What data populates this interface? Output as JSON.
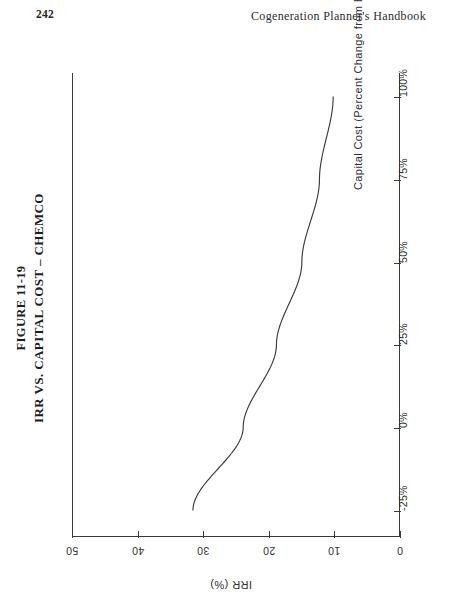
{
  "page": {
    "folio": "242",
    "running_head": "Cogeneration Planner's Handbook"
  },
  "figure": {
    "number": "FIGURE 11-19",
    "title": "IRR VS. CAPITAL COST – CHEMCO",
    "orientation": "rotated-90-ccw"
  },
  "chart_data": {
    "type": "line",
    "title": "IRR VS. CAPITAL COST – CHEMCO",
    "xlabel": "Capital Cost (Percent Change from Base)",
    "ylabel": "IRR (%)",
    "x": [
      -25,
      0,
      25,
      50,
      75,
      100
    ],
    "values": [
      31.6,
      23.9,
      18.8,
      14.9,
      12.2,
      10.1
    ],
    "xtick_labels": [
      "-25%",
      "0%",
      "25%",
      "50%",
      "75%",
      "100%"
    ],
    "ytick_labels": [
      "50",
      "40",
      "30",
      "20",
      "10",
      "0"
    ],
    "ytick_values": [
      50,
      40,
      30,
      20,
      10,
      0
    ],
    "xlim": [
      -25,
      100
    ],
    "ylim": [
      0,
      50
    ],
    "grid": false,
    "legend": false,
    "line_color": "#3a3a3a",
    "series": [
      {
        "name": "IRR",
        "x": [
          -25,
          0,
          25,
          50,
          75,
          100
        ],
        "values": [
          31.6,
          23.9,
          18.8,
          14.9,
          12.2,
          10.1
        ]
      }
    ]
  }
}
